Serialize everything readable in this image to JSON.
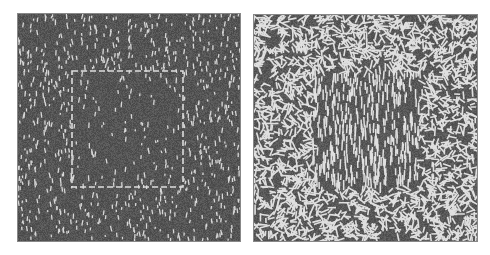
{
  "figure": {
    "panels": [
      {
        "id": "left",
        "description": "Sparse short vertical light line segments on dark gray noise; a dashed light square outline in the center",
        "background": "#555555",
        "segment_color": "#d8d8d8",
        "inner_square": {
          "x": 54,
          "y": 57,
          "w": 111,
          "h": 116
        }
      },
      {
        "id": "right",
        "description": "Dense randomly oriented light line segments surrounding a central square region of vertically oriented segments",
        "background": "#555555",
        "segment_color": "#e0e0e0",
        "inner_square": {
          "x": 59,
          "y": 58,
          "w": 106,
          "h": 114
        }
      }
    ]
  }
}
